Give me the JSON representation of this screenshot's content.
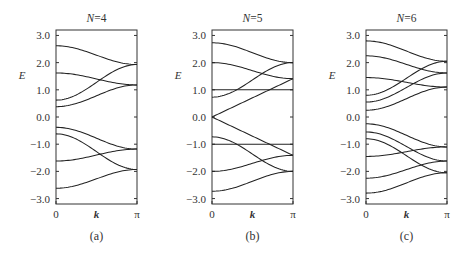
{
  "figure": {
    "width": 466,
    "height": 255,
    "background": "#ffffff",
    "line_color": "#222222"
  },
  "chart_data": [
    {
      "type": "line",
      "panel": "(a)",
      "title": "N=4",
      "title_var": "N",
      "title_value": "=4",
      "xlabel": "k",
      "ylabel": "E",
      "xticks": [
        "0",
        "π"
      ],
      "yticks": [
        "3.0",
        "2.0",
        "1.0",
        "0.0",
        "−1.0",
        "−2.0",
        "−3.0"
      ],
      "ytick_values": [
        3,
        2,
        1,
        0,
        -1,
        -2,
        -3
      ],
      "xlim": [
        0,
        3.1416
      ],
      "ylim": [
        -3.2,
        3.2
      ],
      "grid": false,
      "frame": {
        "left": 56,
        "top": 30,
        "right": 137,
        "bottom": 204
      },
      "series": [
        {
          "name": "band1",
          "x": [
            0,
            3.1416
          ],
          "y_start": 2.62,
          "y_end": 1.93
        },
        {
          "name": "band2",
          "x": [
            0,
            3.1416
          ],
          "y_start": 1.62,
          "y_end": 1.18
        },
        {
          "name": "band3",
          "x": [
            0,
            3.1416
          ],
          "y_start": 0.62,
          "y_end": 1.93
        },
        {
          "name": "band4",
          "x": [
            0,
            3.1416
          ],
          "y_start": 0.38,
          "y_end": 1.18
        },
        {
          "name": "band5",
          "x": [
            0,
            3.1416
          ],
          "y_start": -0.38,
          "y_end": -1.18
        },
        {
          "name": "band6",
          "x": [
            0,
            3.1416
          ],
          "y_start": -0.62,
          "y_end": -1.93
        },
        {
          "name": "band7",
          "x": [
            0,
            3.1416
          ],
          "y_start": -1.62,
          "y_end": -1.18
        },
        {
          "name": "band8",
          "x": [
            0,
            3.1416
          ],
          "y_start": -2.62,
          "y_end": -1.93
        }
      ]
    },
    {
      "type": "line",
      "panel": "(b)",
      "title": "N=5",
      "title_var": "N",
      "title_value": "=5",
      "xlabel": "k",
      "ylabel": "E",
      "xticks": [
        "0",
        "π"
      ],
      "yticks": [
        "3.0",
        "2.0",
        "1.0",
        "0.0",
        "−1.0",
        "−2.0",
        "−3.0"
      ],
      "ytick_values": [
        3,
        2,
        1,
        0,
        -1,
        -2,
        -3
      ],
      "xlim": [
        0,
        3.1416
      ],
      "ylim": [
        -3.2,
        3.2
      ],
      "grid": false,
      "frame": {
        "left": 212,
        "top": 30,
        "right": 293,
        "bottom": 204
      },
      "series": [
        {
          "name": "band1",
          "x": [
            0,
            3.1416
          ],
          "y_start": 2.73,
          "y_end": 2.0
        },
        {
          "name": "band2",
          "x": [
            0,
            3.1416
          ],
          "y_start": 2.0,
          "y_end": 1.41
        },
        {
          "name": "band3",
          "x": [
            0,
            3.1416
          ],
          "y_start": 1.0,
          "y_end": 1.0
        },
        {
          "name": "band4",
          "x": [
            0,
            3.1416
          ],
          "y_start": 0.73,
          "y_end": 2.0
        },
        {
          "name": "band5",
          "x": [
            0,
            3.1416
          ],
          "y_start": 0.0,
          "y_end": 1.41,
          "shape": "linear"
        },
        {
          "name": "band6",
          "x": [
            0,
            3.1416
          ],
          "y_start": 0.0,
          "y_end": -1.41,
          "shape": "linear"
        },
        {
          "name": "band7",
          "x": [
            0,
            3.1416
          ],
          "y_start": -0.73,
          "y_end": -2.0
        },
        {
          "name": "band8",
          "x": [
            0,
            3.1416
          ],
          "y_start": -1.0,
          "y_end": -1.0
        },
        {
          "name": "band9",
          "x": [
            0,
            3.1416
          ],
          "y_start": -2.0,
          "y_end": -1.41
        },
        {
          "name": "band10",
          "x": [
            0,
            3.1416
          ],
          "y_start": -2.73,
          "y_end": -2.0
        }
      ]
    },
    {
      "type": "line",
      "panel": "(c)",
      "title": "N=6",
      "title_var": "N",
      "title_value": "=6",
      "xlabel": "k",
      "ylabel": "E",
      "xticks": [
        "0",
        "π"
      ],
      "yticks": [
        "3.0",
        "2.0",
        "1.0",
        "0.0",
        "−1.0",
        "−2.0",
        "−3.0"
      ],
      "ytick_values": [
        3,
        2,
        1,
        0,
        -1,
        -2,
        -3
      ],
      "xlim": [
        0,
        3.1416
      ],
      "ylim": [
        -3.2,
        3.2
      ],
      "grid": false,
      "frame": {
        "left": 366,
        "top": 30,
        "right": 447,
        "bottom": 204
      },
      "series": [
        {
          "name": "band1",
          "x": [
            0,
            3.1416
          ],
          "y_start": 2.8,
          "y_end": 2.05
        },
        {
          "name": "band2",
          "x": [
            0,
            3.1416
          ],
          "y_start": 2.25,
          "y_end": 1.62
        },
        {
          "name": "band3",
          "x": [
            0,
            3.1416
          ],
          "y_start": 1.45,
          "y_end": 1.1
        },
        {
          "name": "band4",
          "x": [
            0,
            3.1416
          ],
          "y_start": 0.8,
          "y_end": 2.05
        },
        {
          "name": "band5",
          "x": [
            0,
            3.1416
          ],
          "y_start": 0.55,
          "y_end": 1.62
        },
        {
          "name": "band6",
          "x": [
            0,
            3.1416
          ],
          "y_start": 0.25,
          "y_end": 1.1
        },
        {
          "name": "band7",
          "x": [
            0,
            3.1416
          ],
          "y_start": -0.25,
          "y_end": -1.1
        },
        {
          "name": "band8",
          "x": [
            0,
            3.1416
          ],
          "y_start": -0.55,
          "y_end": -1.62
        },
        {
          "name": "band9",
          "x": [
            0,
            3.1416
          ],
          "y_start": -0.8,
          "y_end": -2.05
        },
        {
          "name": "band10",
          "x": [
            0,
            3.1416
          ],
          "y_start": -1.45,
          "y_end": -1.1
        },
        {
          "name": "band11",
          "x": [
            0,
            3.1416
          ],
          "y_start": -2.25,
          "y_end": -1.62
        },
        {
          "name": "band12",
          "x": [
            0,
            3.1416
          ],
          "y_start": -2.8,
          "y_end": -2.05
        }
      ]
    }
  ]
}
